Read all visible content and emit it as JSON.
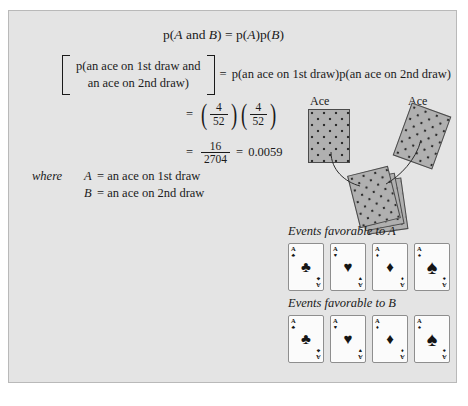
{
  "figure": {
    "background_color": "#e4e4e4",
    "border_color": "#b9b9b9"
  },
  "equations": {
    "line1": {
      "p1": "p",
      "lparen1": "(",
      "varA": "A",
      "and": " and ",
      "varB": "B",
      "rparen1": ")",
      "equals": "=",
      "p2": "p",
      "lparen2": "(",
      "varA2": "A",
      "rparen2": ")",
      "p3": "p",
      "lparen3": "(",
      "varB2": "B",
      "rparen3": ")"
    },
    "line2": {
      "bracket_top": "p(an ace on 1st draw and",
      "bracket_bottom": "an ace on 2nd draw)",
      "equals": "=",
      "right": "p(an ace on 1st draw)p(an ace on 2nd draw)"
    },
    "line3": {
      "equals": "=",
      "frac1_num": "4",
      "frac1_den": "52",
      "frac2_num": "4",
      "frac2_den": "52"
    },
    "line4": {
      "equals": "=",
      "frac_num": "16",
      "frac_den": "2704",
      "equals2": "=",
      "result": "0.0059"
    }
  },
  "where_block": {
    "label": "where",
    "definitions": [
      {
        "symbol": "A",
        "equals": "=",
        "text": "an ace on 1st draw"
      },
      {
        "symbol": "B",
        "equals": "=",
        "text": "an ace on 2nd draw"
      }
    ]
  },
  "illustration": {
    "ace_label_left": "Ace",
    "ace_label_right": "Ace",
    "card_back_color": "#b0b0b0",
    "deck_card_count": 3
  },
  "favorable_rows": [
    {
      "label": "Events favorable to A",
      "cards": [
        {
          "rank": "A",
          "suit_name": "clubs",
          "suit": "♣"
        },
        {
          "rank": "A",
          "suit_name": "hearts",
          "suit": "♥"
        },
        {
          "rank": "A",
          "suit_name": "diamonds",
          "suit": "♦"
        },
        {
          "rank": "A",
          "suit_name": "spades",
          "suit": "♠"
        }
      ]
    },
    {
      "label": "Events favorable to B",
      "cards": [
        {
          "rank": "A",
          "suit_name": "clubs",
          "suit": "♣"
        },
        {
          "rank": "A",
          "suit_name": "hearts",
          "suit": "♥"
        },
        {
          "rank": "A",
          "suit_name": "diamonds",
          "suit": "♦"
        },
        {
          "rank": "A",
          "suit_name": "spades",
          "suit": "♠"
        }
      ]
    }
  ]
}
